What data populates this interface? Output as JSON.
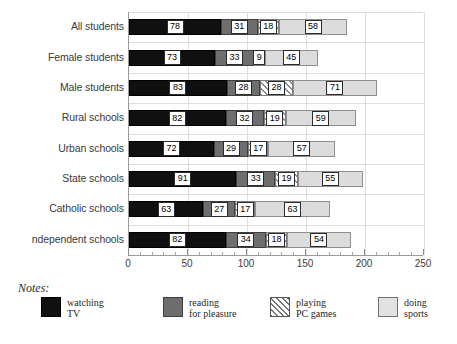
{
  "chart_data": {
    "type": "bar",
    "orientation": "horizontal",
    "stacked": true,
    "title": "",
    "xlabel": "",
    "ylabel": "",
    "xlim": [
      0,
      250
    ],
    "xticks": [
      0,
      50,
      100,
      150,
      200,
      250
    ],
    "xtick_labels": [
      "0",
      "50",
      "100",
      "150",
      "200",
      "250"
    ],
    "minor_tick_step": 10,
    "grid": "both",
    "legend_position": "below-left",
    "categories": [
      "All students",
      "Female students",
      "Male students",
      "Rural schools",
      "Urban schools",
      "State schools",
      "Catholic schools",
      "ndependent schools"
    ],
    "series": [
      {
        "name": "watching TV",
        "color": "#101010",
        "values": [
          78,
          73,
          83,
          82,
          72,
          91,
          63,
          82
        ]
      },
      {
        "name": "reading for pleasure",
        "color": "#6e6e6e",
        "values": [
          31,
          33,
          28,
          32,
          29,
          33,
          27,
          34
        ]
      },
      {
        "name": "playing PC games",
        "color": "#ffffff",
        "pattern": "diagonal-hatch",
        "values": [
          18,
          9,
          28,
          19,
          17,
          19,
          17,
          18
        ]
      },
      {
        "name": "doing sports",
        "color": "#dcdcdc",
        "values": [
          58,
          45,
          71,
          59,
          57,
          55,
          63,
          54
        ]
      }
    ],
    "totals": [
      185,
      160,
      210,
      192,
      175,
      198,
      170,
      188
    ]
  },
  "legend": {
    "items": [
      {
        "swatch": "tv-swatch",
        "line1": "watching",
        "line2": "TV"
      },
      {
        "swatch": "read-swatch",
        "line1": "reading",
        "line2": "for pleasure"
      },
      {
        "swatch": "games-swatch",
        "line1": "playing",
        "line2": "PC games"
      },
      {
        "swatch": "sports-swatch",
        "line1": "doing",
        "line2": "sports"
      }
    ]
  },
  "notes": {
    "label": "Notes:"
  }
}
